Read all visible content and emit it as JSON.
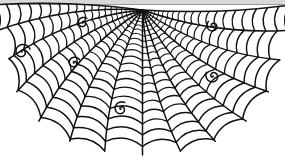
{
  "artwork": {
    "title": "Spider Web",
    "subject": "half spider web with decorative spirals",
    "background_color": "#ffffff",
    "stroke_color": "#111111",
    "width": 285,
    "height": 160
  },
  "top_band": {
    "fill_color": "#d8d8d8",
    "line_color": "#9a9a9a",
    "height": 5
  },
  "web": {
    "hub": {
      "x": 142.5,
      "y": 10
    },
    "radial_count": 13,
    "ring_count": 22,
    "radials": [
      {
        "name": "radial-left-edge",
        "angle_deg": 182,
        "length": 148,
        "sag": 0.05,
        "tip_spiral": false
      },
      {
        "name": "radial-l6",
        "angle_deg": 172,
        "length": 146,
        "sag": 0.1,
        "tip_spiral": true
      },
      {
        "name": "radial-l5",
        "angle_deg": 160,
        "length": 142,
        "sag": 0.13,
        "tip_spiral": true
      },
      {
        "name": "radial-l4",
        "angle_deg": 147,
        "length": 150,
        "sag": 0.14,
        "tip_spiral": true
      },
      {
        "name": "radial-l3",
        "angle_deg": 133,
        "length": 152,
        "sag": 0.14,
        "tip_spiral": false
      },
      {
        "name": "radial-l2",
        "angle_deg": 119,
        "length": 150,
        "sag": 0.13,
        "tip_spiral": true
      },
      {
        "name": "radial-l1",
        "angle_deg": 105,
        "length": 146,
        "sag": 0.1,
        "tip_spiral": false
      },
      {
        "name": "radial-center",
        "angle_deg": 90,
        "length": 145,
        "sag": 0.0,
        "tip_spiral": false
      },
      {
        "name": "radial-r1",
        "angle_deg": 75,
        "length": 146,
        "sag": 0.1,
        "tip_spiral": false
      },
      {
        "name": "radial-r2",
        "angle_deg": 61,
        "length": 150,
        "sag": 0.13,
        "tip_spiral": true
      },
      {
        "name": "radial-r3",
        "angle_deg": 47,
        "length": 152,
        "sag": 0.14,
        "tip_spiral": false
      },
      {
        "name": "radial-r4",
        "angle_deg": 33,
        "length": 150,
        "sag": 0.14,
        "tip_spiral": true
      },
      {
        "name": "radial-r5",
        "angle_deg": 20,
        "length": 146,
        "sag": 0.13,
        "tip_spiral": true
      },
      {
        "name": "radial-r6",
        "angle_deg": 8,
        "length": 146,
        "sag": 0.1,
        "tip_spiral": false
      },
      {
        "name": "radial-right-edge",
        "angle_deg": -2,
        "length": 150,
        "sag": 0.05,
        "tip_spiral": false
      }
    ],
    "ring_radii": [
      6,
      9,
      12.5,
      16.5,
      21,
      26,
      31.5,
      37.5,
      44,
      51,
      58.5,
      66.5,
      75,
      84,
      93.5,
      103.5,
      114,
      125,
      136.5,
      148,
      160,
      172
    ],
    "ring_sag_factor": 0.3,
    "stroke_width_inner": 0.8,
    "stroke_width_outer": 1.6,
    "spirals": [
      {
        "name": "spiral-left-outer",
        "x": 22,
        "y": 52,
        "radius": 8.5,
        "turns": 1.5,
        "rotation_deg": 160
      },
      {
        "name": "spiral-left-mid",
        "x": 74,
        "y": 63,
        "radius": 6.5,
        "turns": 1.5,
        "rotation_deg": 150
      },
      {
        "name": "spiral-top-left",
        "x": 83,
        "y": 23,
        "radius": 6.0,
        "turns": 1.5,
        "rotation_deg": 130
      },
      {
        "name": "spiral-bottom-mid",
        "x": 121,
        "y": 109,
        "radius": 7.5,
        "turns": 1.5,
        "rotation_deg": 120
      },
      {
        "name": "spiral-right-top",
        "x": 213,
        "y": 26,
        "radius": 6.5,
        "turns": 1.5,
        "rotation_deg": 45
      },
      {
        "name": "spiral-right-mid",
        "x": 213,
        "y": 76,
        "radius": 7.5,
        "turns": 1.5,
        "rotation_deg": 30
      }
    ]
  }
}
